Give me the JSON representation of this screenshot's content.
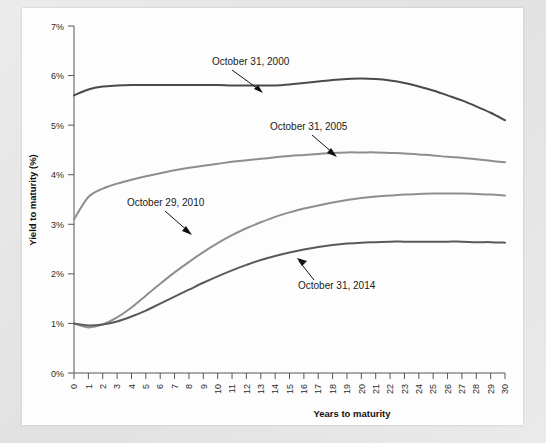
{
  "figure": {
    "background_color": "#e9e9e9",
    "card_color": "#fdfdfd"
  },
  "axes": {
    "y_title": "Yield to maturity (%)",
    "x_title": "Years to maturity",
    "y_ticks": [
      "0%",
      "1%",
      "2%",
      "3%",
      "4%",
      "5%",
      "6%",
      "7%"
    ],
    "x_ticks": [
      "0",
      "1",
      "2",
      "3",
      "4",
      "5",
      "6",
      "7",
      "8",
      "9",
      "10",
      "11",
      "12",
      "13",
      "14",
      "15",
      "16",
      "17",
      "18",
      "19",
      "20",
      "21",
      "22",
      "23",
      "24",
      "25",
      "26",
      "27",
      "28",
      "29",
      "30"
    ]
  },
  "annotations": {
    "a2000": "October 31, 2000",
    "a2005": "October 31, 2005",
    "a2010": "October 29, 2010",
    "a2014": "October 31, 2014"
  },
  "chart_data": {
    "type": "line",
    "title": "",
    "xlabel": "Years to maturity",
    "ylabel": "Yield to maturity (%)",
    "xlim": [
      0,
      30
    ],
    "ylim": [
      0,
      7
    ],
    "grid": false,
    "legend": "annotated-inline",
    "x": [
      0,
      1,
      2,
      3,
      4,
      5,
      6,
      7,
      8,
      9,
      10,
      11,
      12,
      13,
      14,
      15,
      16,
      17,
      18,
      19,
      20,
      21,
      22,
      23,
      24,
      25,
      26,
      27,
      28,
      29,
      30
    ],
    "series": [
      {
        "name": "October 31, 2000",
        "color": "#4a4a4a",
        "width": 2.0,
        "values": [
          5.6,
          5.72,
          5.78,
          5.8,
          5.81,
          5.81,
          5.81,
          5.81,
          5.81,
          5.81,
          5.81,
          5.8,
          5.8,
          5.8,
          5.8,
          5.82,
          5.85,
          5.88,
          5.91,
          5.93,
          5.94,
          5.93,
          5.9,
          5.85,
          5.78,
          5.7,
          5.6,
          5.5,
          5.38,
          5.25,
          5.1
        ]
      },
      {
        "name": "October 31, 2005",
        "color": "#8e8e8e",
        "width": 2.0,
        "values": [
          3.1,
          3.55,
          3.72,
          3.82,
          3.9,
          3.97,
          4.03,
          4.09,
          4.14,
          4.18,
          4.22,
          4.26,
          4.29,
          4.32,
          4.35,
          4.38,
          4.4,
          4.42,
          4.44,
          4.45,
          4.45,
          4.45,
          4.44,
          4.43,
          4.41,
          4.39,
          4.36,
          4.34,
          4.31,
          4.28,
          4.25
        ]
      },
      {
        "name": "October 29, 2010",
        "color": "#8e8e8e",
        "width": 2.0,
        "values": [
          1.0,
          0.92,
          0.98,
          1.12,
          1.32,
          1.56,
          1.8,
          2.03,
          2.24,
          2.44,
          2.62,
          2.78,
          2.92,
          3.04,
          3.15,
          3.24,
          3.32,
          3.38,
          3.44,
          3.49,
          3.53,
          3.56,
          3.58,
          3.6,
          3.61,
          3.62,
          3.62,
          3.62,
          3.61,
          3.6,
          3.58
        ]
      },
      {
        "name": "October 31, 2014",
        "color": "#5a5a5a",
        "width": 2.0,
        "values": [
          1.0,
          0.96,
          0.98,
          1.04,
          1.14,
          1.26,
          1.4,
          1.54,
          1.68,
          1.82,
          1.95,
          2.07,
          2.18,
          2.28,
          2.36,
          2.43,
          2.49,
          2.54,
          2.58,
          2.61,
          2.63,
          2.64,
          2.65,
          2.65,
          2.65,
          2.65,
          2.65,
          2.65,
          2.64,
          2.64,
          2.63
        ]
      }
    ]
  }
}
